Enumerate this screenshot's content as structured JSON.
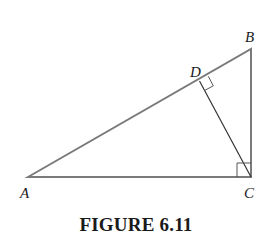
{
  "figure": {
    "caption": "FIGURE 6.11",
    "vertices": {
      "A": {
        "label": "A",
        "x": 28,
        "y": 177
      },
      "B": {
        "label": "B",
        "x": 251,
        "y": 49
      },
      "C": {
        "label": "C",
        "x": 251,
        "y": 177
      },
      "D": {
        "label": "D",
        "x": 199,
        "y": 81
      }
    },
    "segments": [
      "AB",
      "BC",
      "CA",
      "CD"
    ],
    "right_angles": [
      "C (angle ACB)",
      "D (angle CDB)"
    ],
    "colors": {
      "outer_stroke": "#7a7a7a",
      "inner_stroke": "#333333",
      "text": "#1a1a1a"
    }
  }
}
